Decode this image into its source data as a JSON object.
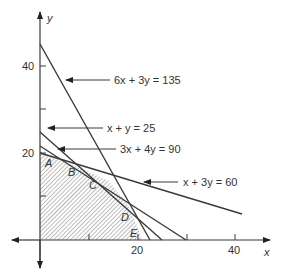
{
  "diagram": {
    "axes": {
      "x_label": "x",
      "y_label": "y",
      "x_ticks": [
        "20",
        "40"
      ],
      "y_ticks": [
        "20",
        "40"
      ]
    },
    "constraints": [
      {
        "label": "6x + 3y = 135"
      },
      {
        "label": "x + y = 25"
      },
      {
        "label": "3x + 4y = 90"
      },
      {
        "label": "x + 3y = 60"
      }
    ],
    "vertices": [
      {
        "label": "A"
      },
      {
        "label": "B"
      },
      {
        "label": "C"
      },
      {
        "label": "D"
      },
      {
        "label": "E"
      }
    ],
    "colors": {
      "line": "#3a3a3a",
      "hatch": "#6b6b6b",
      "text": "#333333"
    }
  }
}
